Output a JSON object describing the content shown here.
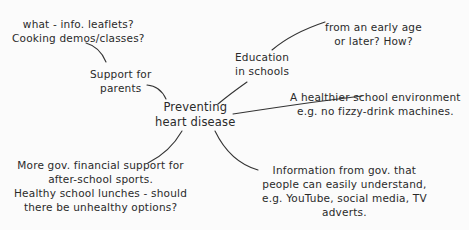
{
  "diagram": {
    "type": "mind-map",
    "central": {
      "lines": [
        "Preventing",
        "heart disease"
      ]
    },
    "branches": [
      {
        "id": "parents",
        "lines": [
          "Support for",
          "parents"
        ],
        "sub": {
          "lines": [
            "what - info. leaflets?",
            "Cooking demos/classes?"
          ]
        }
      },
      {
        "id": "education",
        "lines": [
          "Education",
          "in schools"
        ],
        "sub": {
          "lines": [
            "from an early age",
            "or later? How?"
          ]
        }
      },
      {
        "id": "environment",
        "lines": [
          "A healthier school environment",
          "e.g. no fizzy-drink machines."
        ]
      },
      {
        "id": "funding",
        "lines": [
          "More gov. financial support for",
          "after-school sports.",
          "Healthy school lunches - should",
          "there be unhealthy options?"
        ]
      },
      {
        "id": "information",
        "lines": [
          "Information from gov. that",
          "people can easily understand,",
          "e.g. YouTube, social media, TV",
          "adverts."
        ]
      }
    ],
    "colors": {
      "background": "#fbfbfb",
      "ink": "#2a2a2a"
    }
  }
}
